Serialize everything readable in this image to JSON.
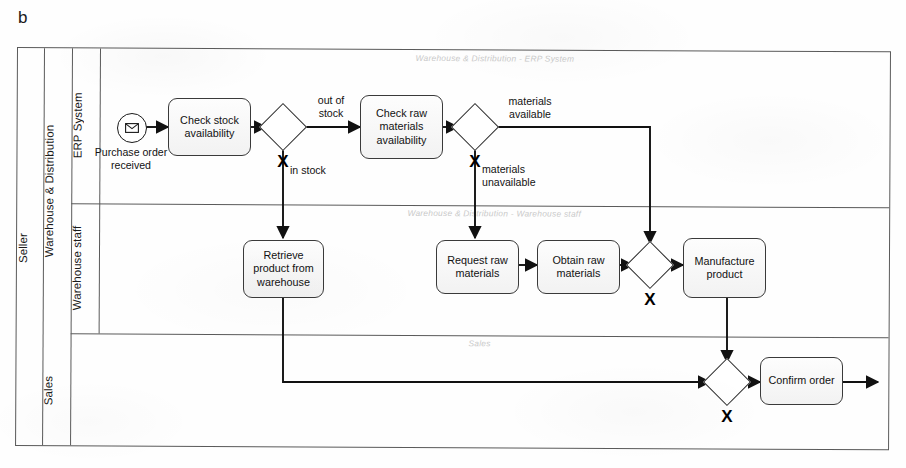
{
  "figure": {
    "label": "b"
  },
  "pool": {
    "name": "Seller"
  },
  "lanes": [
    {
      "id": "warehouse-distribution",
      "label": "Warehouse & Distribution"
    },
    {
      "id": "erp-system",
      "label": "ERP System"
    },
    {
      "id": "warehouse-staff",
      "label": "Warehouse staff"
    },
    {
      "id": "sales",
      "label": "Sales"
    }
  ],
  "lane_watermarks": [
    {
      "id": "wm-erp",
      "text": "Warehouse & Distribution - ERP System"
    },
    {
      "id": "wm-staff",
      "text": "Warehouse & Distribution - Warehouse staff"
    },
    {
      "id": "wm-sales",
      "text": "Sales"
    }
  ],
  "events": [
    {
      "id": "purchase-order-received",
      "type": "message-start-event",
      "icon": "envelope-icon",
      "label": "Purchase order received"
    }
  ],
  "tasks": [
    {
      "id": "check-stock-availability",
      "label": "Check stock availability",
      "lane": "erp-system"
    },
    {
      "id": "check-raw-materials-availability",
      "label": "Check raw materials availability",
      "lane": "erp-system"
    },
    {
      "id": "retrieve-product-from-warehouse",
      "label": "Retrieve product from warehouse",
      "lane": "warehouse-staff"
    },
    {
      "id": "request-raw-materials",
      "label": "Request raw materials",
      "lane": "warehouse-staff"
    },
    {
      "id": "obtain-raw-materials",
      "label": "Obtain raw materials",
      "lane": "warehouse-staff"
    },
    {
      "id": "manufacture-product",
      "label": "Manufacture product",
      "lane": "warehouse-staff"
    },
    {
      "id": "confirm-order",
      "label": "Confirm order",
      "lane": "sales"
    }
  ],
  "gateways": [
    {
      "id": "gw-stock",
      "type": "exclusive",
      "symbol": "X",
      "lane": "erp-system"
    },
    {
      "id": "gw-materials",
      "type": "exclusive",
      "symbol": "X",
      "lane": "erp-system"
    },
    {
      "id": "gw-merge-manufacture",
      "type": "exclusive",
      "symbol": "X",
      "lane": "warehouse-staff"
    },
    {
      "id": "gw-merge-confirm",
      "type": "exclusive",
      "symbol": "X",
      "lane": "sales"
    }
  ],
  "flow_labels": [
    {
      "id": "label-out-of-stock",
      "text": "out of\nstock"
    },
    {
      "id": "label-in-stock",
      "text": "in stock"
    },
    {
      "id": "label-materials-available",
      "text": "materials\navailable"
    },
    {
      "id": "label-materials-unavailable",
      "text": "materials\nunavailable"
    }
  ],
  "colors": {
    "stroke": "#2a2a2a",
    "lane_border": "#5a5a5a",
    "task_fill_top": "#fdfdfd",
    "task_fill_bottom": "#f2f2f2",
    "watermark": "#c9c9c9",
    "text": "#121212"
  }
}
